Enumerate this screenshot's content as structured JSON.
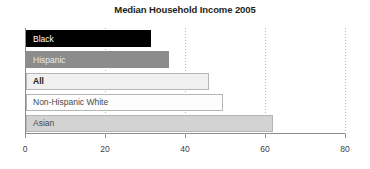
{
  "chart_data": {
    "type": "bar",
    "orientation": "horizontal",
    "title": "Median Household Income 2005",
    "xlabel": "",
    "ylabel": "",
    "categories": [
      "Black",
      "Hispanic",
      "All",
      "Non-Hispanic White",
      "Asian"
    ],
    "values": [
      31.2,
      35.7,
      45.7,
      49.2,
      61.8
    ],
    "bar_colors": [
      "#000000",
      "#8c8c8c",
      "#f0f0f0",
      "#fdfdfd",
      "#d2d2d2"
    ],
    "bar_label_colors": [
      "#ffffff",
      "#e8e8e8",
      "#231f20",
      "#4a4a4a",
      "#4a4a4a"
    ],
    "bar_border_colors": [
      "#000000",
      "#8c8c8c",
      "#b5b5b5",
      "#b5b5b5",
      "#b5b5b5"
    ],
    "emphasized_category": "All",
    "xlim": [
      0,
      80
    ],
    "xticks": [
      0,
      20,
      40,
      60,
      80
    ],
    "xtick_labels": [
      "0",
      "20",
      "40",
      "60",
      "80"
    ],
    "gridlines": [
      20,
      40,
      60,
      80
    ],
    "grid": true,
    "grid_style": "dotted",
    "grid_color": "#b8b8b8",
    "axis_color": "#8c8c8c",
    "legend": null,
    "legend_position": "none",
    "labels_inside_bars": true
  }
}
